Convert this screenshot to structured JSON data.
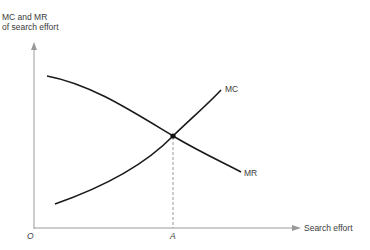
{
  "figure": {
    "y_axis_label_line1": "MC and MR",
    "y_axis_label_line2": "of search effort",
    "x_axis_label": "Search effort",
    "origin_label": "O",
    "equilibrium_label": "A",
    "curves": [
      {
        "name": "MC",
        "label": "MC",
        "shape": "upward-sloping, convex"
      },
      {
        "name": "MR",
        "label": "MR",
        "shape": "downward-sloping"
      }
    ],
    "colors": {
      "curve": "#1a1a1a",
      "axis": "#9a9a9a",
      "text": "#3a3a3a"
    }
  }
}
